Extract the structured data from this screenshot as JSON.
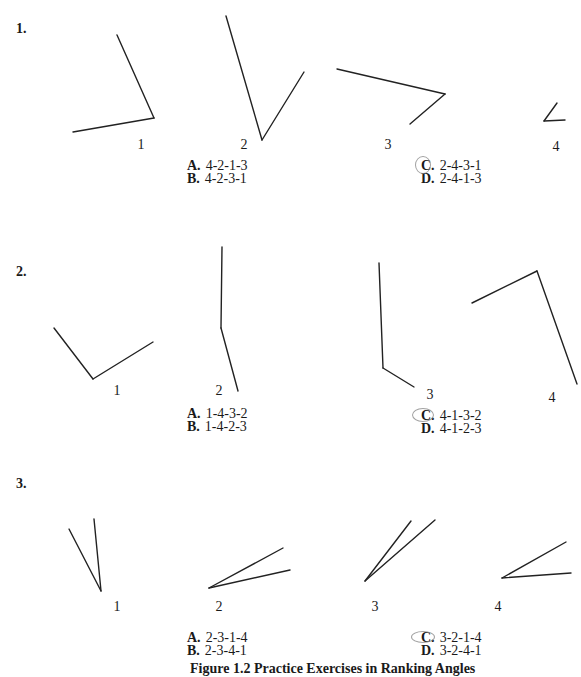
{
  "questions": [
    {
      "number": "1.",
      "angle_labels": [
        "1",
        "2",
        "3",
        "4"
      ],
      "choices": [
        {
          "letter": "A.",
          "text": "4-2-1-3"
        },
        {
          "letter": "B.",
          "text": "4-2-3-1"
        },
        {
          "letter": "C.",
          "text": "2-4-3-1",
          "marked": true
        },
        {
          "letter": "D.",
          "text": "2-4-1-3"
        }
      ]
    },
    {
      "number": "2.",
      "angle_labels": [
        "1",
        "2",
        "3",
        "4"
      ],
      "choices": [
        {
          "letter": "A.",
          "text": "1-4-3-2"
        },
        {
          "letter": "B.",
          "text": "1-4-2-3"
        },
        {
          "letter": "C.",
          "text": "4-1-3-2",
          "marked": true
        },
        {
          "letter": "D.",
          "text": "4-1-2-3"
        }
      ]
    },
    {
      "number": "3.",
      "angle_labels": [
        "1",
        "2",
        "3",
        "4"
      ],
      "choices": [
        {
          "letter": "A.",
          "text": "2-3-1-4"
        },
        {
          "letter": "B.",
          "text": "2-3-4-1"
        },
        {
          "letter": "C.",
          "text": "3-2-1-4",
          "marked": true
        },
        {
          "letter": "D.",
          "text": "3-2-4-1"
        }
      ]
    }
  ],
  "caption": "Figure 1.2   Practice Exercises in Ranking Angles"
}
